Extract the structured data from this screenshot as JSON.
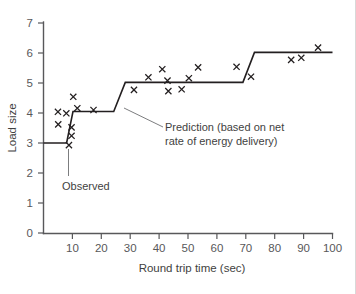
{
  "chart_data": {
    "type": "scatter",
    "title": "",
    "xlabel": "Round trip time (sec)",
    "ylabel": "Load size",
    "xlim": [
      0,
      100
    ],
    "ylim": [
      0,
      7
    ],
    "xticks": [
      10,
      20,
      30,
      40,
      50,
      60,
      70,
      80,
      90,
      100
    ],
    "yticks": [
      0,
      1,
      2,
      3,
      4,
      5,
      6,
      7
    ],
    "grid": false,
    "legend_position": "none",
    "series": [
      {
        "name": "Observed",
        "type": "scatter",
        "marker": "x",
        "color": "#231f20",
        "points": [
          {
            "x": 5.0,
            "y": 4.04
          },
          {
            "x": 5.1,
            "y": 3.62
          },
          {
            "x": 7.9,
            "y": 3.99
          },
          {
            "x": 8.8,
            "y": 2.93
          },
          {
            "x": 9.7,
            "y": 3.52
          },
          {
            "x": 9.7,
            "y": 3.24
          },
          {
            "x": 10.3,
            "y": 4.54
          },
          {
            "x": 11.7,
            "y": 4.16
          },
          {
            "x": 17.3,
            "y": 4.1
          },
          {
            "x": 31.3,
            "y": 4.77
          },
          {
            "x": 36.3,
            "y": 5.19
          },
          {
            "x": 41.1,
            "y": 5.46
          },
          {
            "x": 42.9,
            "y": 5.08
          },
          {
            "x": 43.2,
            "y": 4.73
          },
          {
            "x": 47.8,
            "y": 4.79
          },
          {
            "x": 50.3,
            "y": 5.16
          },
          {
            "x": 53.5,
            "y": 5.52
          },
          {
            "x": 66.8,
            "y": 5.54
          },
          {
            "x": 71.8,
            "y": 5.21
          },
          {
            "x": 85.7,
            "y": 5.77
          },
          {
            "x": 89.2,
            "y": 5.84
          },
          {
            "x": 95.0,
            "y": 6.18
          }
        ]
      },
      {
        "name": "Prediction (based on net rate of energy delivery)",
        "type": "step-line",
        "color": "#231f20",
        "points": [
          {
            "x": 0.0,
            "y": 3.0
          },
          {
            "x": 8.0,
            "y": 3.0
          },
          {
            "x": 10.2,
            "y": 4.05
          },
          {
            "x": 24.3,
            "y": 4.05
          },
          {
            "x": 28.3,
            "y": 5.02
          },
          {
            "x": 69.0,
            "y": 5.02
          },
          {
            "x": 73.0,
            "y": 6.02
          },
          {
            "x": 100.0,
            "y": 6.02
          }
        ]
      }
    ],
    "annotations": [
      {
        "name": "prediction-annotation",
        "lines": [
          "Prediction (based on net",
          "rate of energy delivery)"
        ],
        "text": "Prediction (based on net rate of energy delivery)",
        "anchor_x": 26.5,
        "anchor_y": 4.6
      },
      {
        "name": "observed-annotation",
        "lines": [
          "Observed"
        ],
        "text": "Observed",
        "anchor_x": 8.8,
        "anchor_y": 2.95
      }
    ]
  },
  "axes": {
    "y_title": "Load size",
    "x_title": "Round trip time (sec)",
    "y_tick_labels": [
      "7",
      "6",
      "5",
      "4",
      "3",
      "2",
      "1",
      "0"
    ],
    "x_tick_labels": [
      "10",
      "20",
      "30",
      "40",
      "50",
      "60",
      "70",
      "80",
      "90",
      "100"
    ]
  },
  "annotations": {
    "prediction_line_1": "Prediction (based on net",
    "prediction_line_2": "rate of energy delivery)",
    "observed": "Observed"
  },
  "colors": {
    "ink": "#231f20",
    "axis": "#58585a",
    "text": "#3f3f41",
    "background": "#ffffff",
    "caption": "#9a9a9c"
  }
}
